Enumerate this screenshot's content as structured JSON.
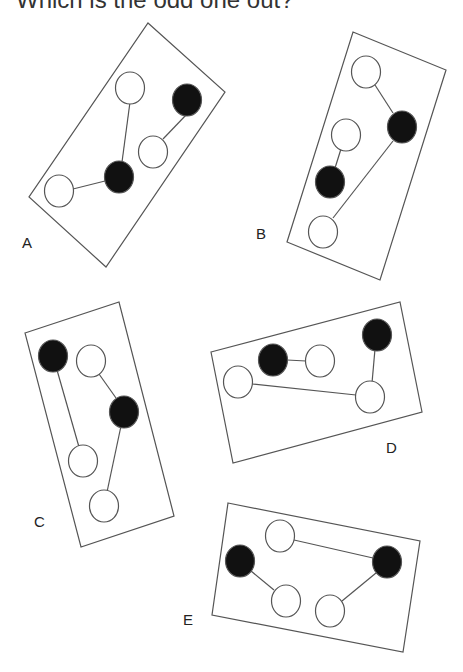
{
  "title": "Which is the odd one out?",
  "colors": {
    "line": "#555555",
    "black": "#111111",
    "white": "#ffffff"
  },
  "panels": [
    {
      "label": "A",
      "label_pos": [
        22,
        234
      ],
      "rect": [
        [
          148,
          23
        ],
        [
          225,
          92
        ],
        [
          106,
          267
        ],
        [
          29,
          197
        ]
      ],
      "circles": [
        {
          "c": [
            130,
            88
          ],
          "f": "white"
        },
        {
          "c": [
            187,
            100
          ],
          "f": "black"
        },
        {
          "c": [
            153,
            152
          ],
          "f": "white"
        },
        {
          "c": [
            119,
            177
          ],
          "f": "black"
        },
        {
          "c": [
            59,
            191
          ],
          "f": "white"
        }
      ],
      "lines": [
        [
          [
            130,
            102
          ],
          [
            122,
            162
          ]
        ],
        [
          [
            187,
            114
          ],
          [
            163,
            139
          ]
        ],
        [
          [
            73,
            189
          ],
          [
            105,
            181
          ]
        ]
      ]
    },
    {
      "label": "B",
      "label_pos": [
        256,
        225
      ],
      "rect": [
        [
          353,
          32
        ],
        [
          446,
          70
        ],
        [
          380,
          280
        ],
        [
          287,
          242
        ]
      ],
      "circles": [
        {
          "c": [
            366,
            72
          ],
          "f": "white"
        },
        {
          "c": [
            402,
            127
          ],
          "f": "black"
        },
        {
          "c": [
            346,
            135
          ],
          "f": "white"
        },
        {
          "c": [
            330,
            182
          ],
          "f": "black"
        },
        {
          "c": [
            323,
            232
          ],
          "f": "white"
        }
      ],
      "lines": [
        [
          [
            375,
            85
          ],
          [
            393,
            113
          ]
        ],
        [
          [
            341,
            149
          ],
          [
            335,
            168
          ]
        ],
        [
          [
            393,
            141
          ],
          [
            333,
            218
          ]
        ]
      ]
    },
    {
      "label": "C",
      "label_pos": [
        34,
        513
      ],
      "rect": [
        [
          25,
          333
        ],
        [
          119,
          302
        ],
        [
          174,
          516
        ],
        [
          81,
          547
        ]
      ],
      "circles": [
        {
          "c": [
            53,
            356
          ],
          "f": "black"
        },
        {
          "c": [
            91,
            361
          ],
          "f": "white"
        },
        {
          "c": [
            124,
            412
          ],
          "f": "black"
        },
        {
          "c": [
            83,
            461
          ],
          "f": "white"
        },
        {
          "c": [
            104,
            506
          ],
          "f": "white"
        }
      ],
      "lines": [
        [
          [
            57,
            370
          ],
          [
            79,
            447
          ]
        ],
        [
          [
            99,
            374
          ],
          [
            116,
            398
          ]
        ],
        [
          [
            121,
            426
          ],
          [
            107,
            492
          ]
        ]
      ]
    },
    {
      "label": "D",
      "label_pos": [
        386,
        439
      ],
      "rect": [
        [
          211,
          352
        ],
        [
          400,
          302
        ],
        [
          422,
          412
        ],
        [
          233,
          463
        ]
      ],
      "circles": [
        {
          "c": [
            273,
            360
          ],
          "f": "black"
        },
        {
          "c": [
            320,
            361
          ],
          "f": "white"
        },
        {
          "c": [
            377,
            335
          ],
          "f": "black"
        },
        {
          "c": [
            238,
            382
          ],
          "f": "white"
        },
        {
          "c": [
            370,
            397
          ],
          "f": "white"
        }
      ],
      "lines": [
        [
          [
            287,
            360
          ],
          [
            306,
            361
          ]
        ],
        [
          [
            252,
            384
          ],
          [
            356,
            395
          ]
        ],
        [
          [
            375,
            349
          ],
          [
            372,
            383
          ]
        ]
      ]
    },
    {
      "label": "E",
      "label_pos": [
        183,
        611
      ],
      "rect": [
        [
          228,
          503
        ],
        [
          420,
          541
        ],
        [
          403,
          652
        ],
        [
          212,
          615
        ]
      ],
      "circles": [
        {
          "c": [
            280,
            536
          ],
          "f": "white"
        },
        {
          "c": [
            240,
            561
          ],
          "f": "black"
        },
        {
          "c": [
            387,
            562
          ],
          "f": "black"
        },
        {
          "c": [
            286,
            601
          ],
          "f": "white"
        },
        {
          "c": [
            330,
            611
          ],
          "f": "white"
        }
      ],
      "lines": [
        [
          [
            294,
            540
          ],
          [
            373,
            558
          ]
        ],
        [
          [
            251,
            571
          ],
          [
            274,
            590
          ]
        ],
        [
          [
            376,
            573
          ],
          [
            342,
            601
          ]
        ]
      ]
    }
  ]
}
